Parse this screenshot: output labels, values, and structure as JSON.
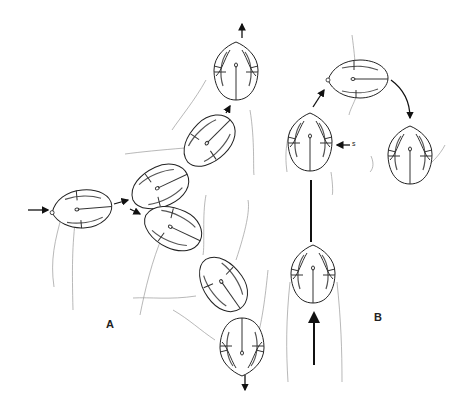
{
  "figure": {
    "type": "scientific line drawing",
    "panels": [
      {
        "id": "A",
        "label": "A",
        "description": "Chain of seven grains: one entering from the left (horizontal arrow), branching into an upward sequence of three and a downward sequence of three",
        "grain_count": 7,
        "arrows": [
          "left-entry",
          "upper-branch",
          "lower-branch",
          "top-exit-up",
          "bottom-exit-down"
        ]
      },
      {
        "id": "B",
        "label": "B",
        "description": "Three-step sequence: grain pushed up from below, rotating sideways at top, then flipped downward at right",
        "grain_count": 4,
        "annotation": "s",
        "arrows": [
          "bottom-entry-up",
          "up-to-top",
          "top-curve-to-right",
          "side-pointer-s"
        ]
      }
    ],
    "labels": {
      "panel_a": "A",
      "panel_b": "B",
      "side_marker": "s"
    },
    "colors": {
      "background": "#ffffff",
      "line": "#222222",
      "thread": "#999999"
    }
  }
}
